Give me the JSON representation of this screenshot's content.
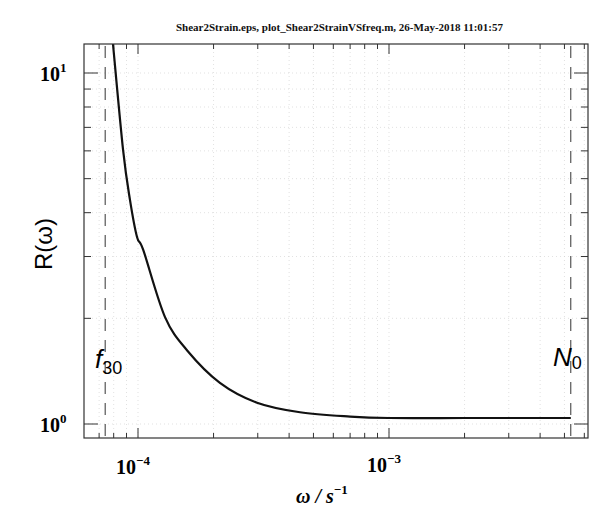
{
  "header": {
    "text": "Shear2Strain.eps, plot_Shear2StrainVSfreq.m, 26-May-2018 11:01:57"
  },
  "axes": {
    "xlabel_main": "ω / s",
    "xlabel_sup": "−1",
    "ylabel": "R(ω)",
    "xtick_labels": [
      {
        "base": "10",
        "exp": "−4",
        "value": 0.0001
      },
      {
        "base": "10",
        "exp": "−3",
        "value": 0.001
      }
    ],
    "ytick_labels": [
      {
        "base": "10",
        "exp": "0",
        "value": 1
      },
      {
        "base": "10",
        "exp": "1",
        "value": 10
      }
    ]
  },
  "annotations": [
    {
      "label_main": "f",
      "label_sub": "30",
      "x": 7.4e-05
    },
    {
      "label_main": "N",
      "label_sub": "0",
      "x": 0.0053
    }
  ],
  "colors": {
    "curve": "#111111",
    "axis": "#333333",
    "grid": "#cccccc",
    "text": "#111111"
  },
  "chart_data": {
    "type": "line",
    "title": "Shear2Strain.eps, plot_Shear2StrainVSfreq.m, 26-May-2018 11:01:57",
    "xlabel": "ω / s^-1",
    "ylabel": "R(ω)",
    "xscale": "log",
    "yscale": "log",
    "xlim": [
      6e-05,
      0.0062
    ],
    "ylim": [
      0.91,
      12.1
    ],
    "grid": true,
    "legend": null,
    "series": [
      {
        "name": "R(ω)",
        "x": [
          7.95e-05,
          8.72e-05,
          9.29e-05,
          9.91e-05,
          0.000105,
          0.000128,
          0.000157,
          0.000212,
          0.000298,
          0.000442,
          0.0007,
          0.001,
          0.002,
          0.0035,
          0.0053
        ],
        "y": [
          12.1,
          6.04,
          4.35,
          3.41,
          3.13,
          2.02,
          1.62,
          1.31,
          1.15,
          1.08,
          1.05,
          1.04,
          1.04,
          1.04,
          1.04
        ]
      }
    ],
    "vertical_lines": [
      {
        "x": 7.4e-05,
        "label": "f_30",
        "style": "dashed"
      },
      {
        "x": 0.0053,
        "label": "N_0",
        "style": "dashed"
      }
    ],
    "xticks_major": [
      0.0001,
      0.001
    ],
    "yticks_major": [
      1,
      10
    ]
  }
}
